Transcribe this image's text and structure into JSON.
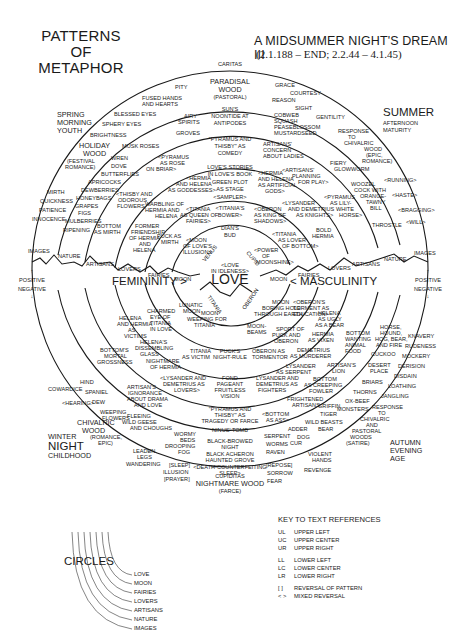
{
  "header": {
    "left_title_lines": [
      "PATTERNS",
      "OF",
      "METAPHOR"
    ],
    "right_title": "A MIDSUMMER NIGHT'S DREAM III",
    "right_subtitle": "(2.1.188 – END; 2.2.44 – 4.1.45)"
  },
  "diagram": {
    "top_label": "CARITAS",
    "bottom_label": "CUPIDITAS",
    "center_label": "LOVE",
    "femininity": "FEMININITY >",
    "masculinity": "< MASCULINITY",
    "positive_left": "POSITIVE",
    "negative_left": "NEGATIVE",
    "positive_right": "POSITIVE",
    "negative_right": "NEGATIVE",
    "season_labels": {
      "spring": [
        "SPRING",
        "MORNING",
        "YOUTH"
      ],
      "summer": [
        "SUMMER",
        "AFTERNOON",
        "MATURITY"
      ],
      "autumn": [
        "AUTUMN",
        "EVENING",
        "AGE"
      ],
      "winter": [
        "WINTER",
        "NIGHT",
        "CHILDHOOD"
      ]
    },
    "ring_labels_left": [
      "IMAGES",
      "NATURE",
      "ARTISANS",
      "LOVERS",
      "FAIRIES",
      "MOON"
    ],
    "ring_labels_right": [
      "MOON",
      "FAIRIES",
      "LOVERS",
      "ARTISANS",
      "NATURE",
      "IMAGES"
    ],
    "arc_labels": {
      "venus": "VENUS",
      "cupid": "CUPID",
      "titania": "TITANIA",
      "oberon": "OBERON"
    },
    "upper_center": [
      "PARADISAL",
      "WOOD",
      "(PASTORAL)",
      "SUN'S",
      "NOONTIDE AT",
      "ANTIPODES",
      "\"PYRAMUS AND",
      "THISBY\" AS",
      "COMEDY",
      "LOVE'S STORIES",
      "IN LOVE'S BOOK",
      "GREEN PLOT",
      "AS STAGE",
      "<SAMPLER>",
      "<TITANIA'S",
      "BOWER>",
      "DIAN'S",
      "BUD",
      "<LOVE",
      "IN IDLENESS>"
    ],
    "upper_left": [
      "PITY",
      "FUSED HANDS",
      "AND HEARTS",
      "AIRY",
      "SPIRITS",
      "GROVES",
      "BLESSED EYES",
      "SPHERY EYES",
      "BRIGHTNESS",
      "MUSK ROSES",
      "HOLIDAY",
      "WOOD",
      "(FESTIVAL",
      "ROMANCE)",
      "WREN",
      "DOVE",
      "BUTTERFLIES",
      "APRICOCKS",
      "DEWBERRIES",
      "HONEYBAGS",
      "GRAPES",
      "FIGS",
      "MULBERRIES",
      "RIPENING",
      "MIRTH",
      "QUICKNESS",
      "PATIENCE",
      "INNOCENCE",
      "<THISBY AND",
      "ODOROUS",
      "FLOWERS",
      "BOTTOM",
      "AS MIRTH",
      "<PYRAMUS",
      "AS ROSE",
      "ON BRIAR>",
      "<HERMIA",
      "AND HELENA",
      "AS GODDESSES>",
      "WARBLING OF",
      "HERMIA AND",
      "HELENA",
      "FORMER",
      "FRIENDSHIP",
      "OF HERMIA",
      "AND",
      "HELENA",
      "<TITANIA",
      "AS QUEEN OF",
      "FAIRIES>",
      "PUCK AS",
      "MIRTH",
      "<MOON",
      "OF LOVE'S",
      "ILLUSION>"
    ],
    "upper_right": [
      "GRACE",
      "COURTESY",
      "REASON",
      "SIGHT",
      "GENTILITY",
      "COBWEB",
      "SQUASH",
      "PEASEBLOSSOM",
      "MUSTARDSEED",
      "ARTISANS'",
      "CONCERN",
      "ABOUT LADIES",
      "RESPONSE",
      "TO",
      "CHIVALRIC",
      "WOOD",
      "(EPIC,",
      "ROMANCE)",
      "FIERY",
      "GLOWWORM",
      "<ARTISANS'",
      "PLANNING",
      "FOR PLAY>",
      "<HERMIA",
      "AND HELENA",
      "AS ARTIFICIAL",
      "GODS>",
      "<LYSANDER",
      "AND DEMETRIUS",
      "AS KNIGHTS>",
      "<OBERON",
      "AS KING OF",
      "SHADOWS>",
      "<TITANIA",
      "AS LOVER",
      "OF BOTTOM>",
      "<POWER",
      "OF",
      "MOONSHINE>",
      "BOLD",
      "HERMIA",
      "<PYRAMUS",
      "AS LILY-",
      "WHITE",
      "HORSE>",
      "WOOZEL",
      "COCK WITH",
      "ORANGE-",
      "TAWNY",
      "BILL",
      "THROSTLE",
      "<RUNNING>",
      "<HASTE>",
      "<BRAGGING>",
      "<WILL>"
    ],
    "lower_left": [
      "LUNATIC",
      "MOON",
      "MOON",
      "WEEPING FOR",
      "TITANIA",
      "CHARMED",
      "EYE OF",
      "TITANIA",
      "IN LOVE",
      "HELENA",
      "AND HERMIA",
      "AS",
      "VICTIMS",
      "TITANIA",
      "AS VICTIM",
      "HELENA'S",
      "DISSEMBLING",
      "GLASS",
      "NIGHTMARE",
      "OF HERMIA",
      "<LYSANDER AND",
      "DEMETRIUS AS",
      "LOVERS>",
      "BOTTOM'S",
      "MORTAL",
      "GROSSNESS",
      "ARTISAN'S",
      "IGNORANCE",
      "ABOUT DRAMA",
      "AND LOVE",
      "HIND",
      "SPANIEL",
      "DEW",
      "COWARDICE",
      "<HEARING>",
      "WEEPING",
      "FLOWERS",
      "FLEEING",
      "WILD GEESE",
      "AND CHOUGHS",
      "CHIVALRIC",
      "WOOD",
      "(ROMANCE,",
      "EPIC)",
      "WORMY",
      "BEDS",
      "DROOPING",
      "FOG",
      "LEADEN",
      "LEGS",
      "WANDERING",
      "[SLEEP]",
      "ILLUSION",
      "[PRAYER]"
    ],
    "lower_center": [
      "PUCK'S",
      "NIGHT-RULE",
      "FOND",
      "PAGEANT",
      "FRUITLESS",
      "VISION",
      "\"PYRAMUS AND",
      "THISBY\" AS",
      "TRAGEDY OR FARCE",
      "NINUS' TOMB",
      "BLACK-BROWED",
      "NIGHT",
      "BLACK ACHERON",
      "HAUNTED GROVE",
      "<DEATH-COUNTERFEITING",
      "SLEEP>",
      "NIGHTMARE WOOD",
      "(FARCE)"
    ],
    "lower_right": [
      "MOON",
      "BORING HOLE",
      "THROUGH EARTH",
      "MOON-",
      "BEAMS",
      "<OBERON'S",
      "TORMENT AS",
      "EDUCATION>",
      "SPORT OF",
      "PUCK AND",
      "OBERON",
      "OBERON AS",
      "TORMENTOR",
      "HELENA",
      "AS UGLY",
      "AS A BEAR",
      "HERMIA",
      "AS VIXEN",
      "DEMETRIUS",
      "AS MURDERER",
      "LYSANDER",
      "AS SERPENT",
      "LYSANDER AND",
      "DEMETRIUS AS",
      "FIGHTERS",
      "FRIGHTENED",
      "ARTISANS",
      "<BOTTOM",
      "AS ASS>",
      "SERPENT",
      "WORMS",
      "RAVEN",
      "[REPOSE]",
      "SORROW",
      "FEAR",
      "BOTTOM",
      "WANTING",
      "ANIMAL",
      "FOOD",
      "ARTISAN'S",
      "LION",
      "BOTTOM",
      "AS CREEPING",
      "FOWLER",
      "GRIFFIN",
      "TIGER",
      "WILD BEASTS",
      "ADDER",
      "BEAR",
      "DOG",
      "CUR",
      "VIOLENT",
      "HANDS",
      "REVENGE",
      "HORSE,",
      "HOUND,",
      "HOG, BEAR,",
      "AND FIRE",
      "CUCKOO",
      "DESERT",
      "PLACE",
      "BRIARS",
      "THORNS",
      "OX-BEEF",
      "MONSTERS",
      "RESPONSE",
      "TO",
      "CHIVALRIC",
      "AND",
      "PASTORAL",
      "WOODS",
      "(SATIRE)",
      "KNAVERY",
      "RUDENESS",
      "MOCKERY",
      "DERISION",
      "DISDAIN",
      "LOATHING",
      "JANGLING"
    ]
  },
  "circles_legend": {
    "title": "CIRCLES",
    "items": [
      "LOVE",
      "MOON",
      "FAIRIES",
      "LOVERS",
      "ARTISANS",
      "NATURE",
      "IMAGES"
    ]
  },
  "key": {
    "title": "KEY TO TEXT REFERENCES",
    "rows": [
      {
        "abbr": "UL",
        "desc": "UPPER LEFT"
      },
      {
        "abbr": "UC",
        "desc": "UPPER CENTER"
      },
      {
        "abbr": "UR",
        "desc": "UPPER RIGHT"
      },
      {
        "abbr": "LL",
        "desc": "LOWER LEFT"
      },
      {
        "abbr": "LC",
        "desc": "LOWER CENTER"
      },
      {
        "abbr": "LR",
        "desc": "LOWER RIGHT"
      },
      {
        "abbr": "[ ]",
        "desc": "REVERSAL OF PATTERN"
      },
      {
        "abbr": "< >",
        "desc": "MIXED REVERSAL"
      }
    ]
  }
}
